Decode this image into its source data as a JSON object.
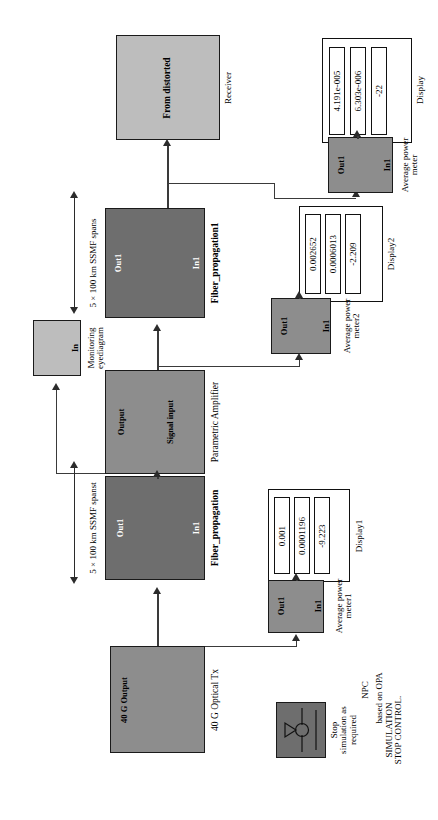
{
  "diagram": {
    "title_note": "NPC based on OPA",
    "orientation": "rotated-90",
    "colors": {
      "dark_block": "#6e6e6e",
      "mid_block": "#8d8d8d",
      "light_block": "#bdbdbd",
      "wire": "#3a3a3a",
      "text": "#000000"
    }
  },
  "blocks": {
    "receiver": {
      "label": "Receiver",
      "inner_text": "From distorted",
      "fill": "#bdbdbd"
    },
    "fiber_propagation1": {
      "label": "Fiber_propagation1",
      "port_in": "In1",
      "port_out": "Out1",
      "annotation": "5 × 100 km SSMF spans",
      "fill": "#6e6e6e"
    },
    "parametric_amplifier": {
      "label": "Parametric Amplifier",
      "port_in": "Signal input",
      "port_out": "Output",
      "fill": "#8d8d8d"
    },
    "monitoring_eyediagram": {
      "label": "Monitoring eyediagram",
      "port_in": "In",
      "fill": "#bdbdbd"
    },
    "fiber_propagation": {
      "label": "Fiber_propagation",
      "port_in": "In1",
      "port_out": "Out1",
      "annotation": "5 × 100 km SSMF spanst",
      "fill": "#6e6e6e"
    },
    "optical_tx": {
      "label": "40 G Optical Tx",
      "port_out": "40 G Output",
      "fill": "#8d8d8d"
    },
    "avg_power_meter": {
      "label": "Average power meter",
      "port_in": "In1",
      "port_out": "Out1",
      "fill": "#8d8d8d"
    },
    "avg_power_meter1": {
      "label": "Average power meter1",
      "port_in": "In1",
      "port_out": "Out1",
      "fill": "#8d8d8d"
    },
    "avg_power_meter2": {
      "label": "Average power meter2",
      "port_in": "In1",
      "port_out": "Out1",
      "fill": "#8d8d8d"
    },
    "stop_control": {
      "label_top": "Stop simulation as required",
      "label_bottom": "SIMULATION STOP CONTROL.",
      "fill": "#6e6e6e"
    }
  },
  "displays": {
    "display": {
      "label": "Display",
      "values": [
        "4.191e-005",
        "6.303e-006",
        "-22"
      ]
    },
    "display1": {
      "label": "Display1",
      "values": [
        "0.001",
        "0.0001196",
        "-9.223"
      ]
    },
    "display2": {
      "label": "Display2",
      "values": [
        "0.002652",
        "0.0006013",
        "-2.209"
      ]
    }
  },
  "annotations": {
    "npc_line1": "NPC",
    "npc_line2": "based on OPA"
  }
}
